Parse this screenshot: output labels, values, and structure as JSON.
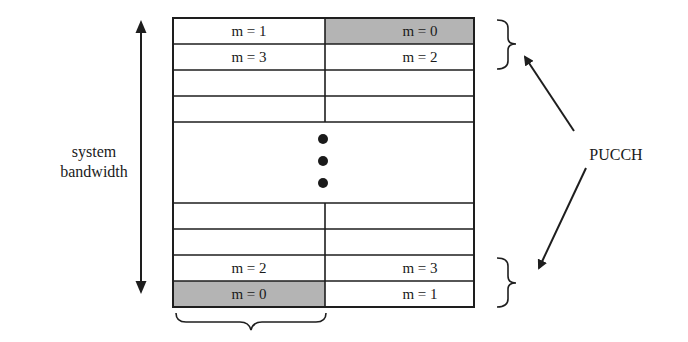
{
  "diagram": {
    "left_label": {
      "line1": "system",
      "line2": "bandwidth"
    },
    "right_label": "PUCCH",
    "colors": {
      "shaded": "#b4b4b4",
      "line": "#1e1e1e",
      "background": "#ffffff"
    },
    "grid": {
      "top_rows": [
        {
          "left": "m = 1",
          "right": "m = 0",
          "right_shaded": true
        },
        {
          "left": "m = 3",
          "right": "m = 2"
        },
        {
          "left": "",
          "right": ""
        },
        {
          "left": "",
          "right": ""
        }
      ],
      "bottom_rows": [
        {
          "left": "",
          "right": ""
        },
        {
          "left": "",
          "right": ""
        },
        {
          "left": "m = 2",
          "right": "m = 3"
        },
        {
          "left": "m = 0",
          "right": "m = 1",
          "left_shaded": true
        }
      ],
      "ellipsis": "vertical-dots"
    }
  }
}
